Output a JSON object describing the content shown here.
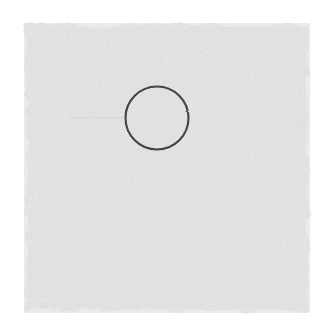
{
  "canvas": {
    "width": 333,
    "height": 330,
    "background_color": "#ffffff",
    "title": "Sketch Canvas",
    "description": "A light grey textured square shaded region on a white background with a thin dark circle outline drawn near its upper middle, and a faint horizontal line to the left of the circle."
  },
  "shapes": {
    "shaded_square": {
      "name": "shaded-square",
      "label": "Shaded Square Region",
      "fill_color": "#eeeeee",
      "edge_color": "#e4e4e4",
      "x": 24,
      "y": 23,
      "width": 286,
      "height": 290,
      "texture": "grainy-pencil-shading",
      "opacity": 1
    },
    "circle_outline": {
      "name": "circle-outline",
      "label": "Circle Outline",
      "stroke_color": "#404040",
      "fill": "none",
      "center_x": 157,
      "center_y": 118,
      "radius": 31.5,
      "stroke_width": 2.1
    },
    "faint_line": {
      "name": "faint-horizontal-line",
      "label": "Faint Horizontal Line",
      "stroke_color": "#d8d8d8",
      "x1": 56,
      "y1": 117,
      "x2": 125,
      "y2": 117,
      "stroke_width": 1
    }
  },
  "colors": {
    "background": "#ffffff",
    "shading": "#eeeeee",
    "ink": "#404040",
    "faint_ink": "#d8d8d8"
  }
}
